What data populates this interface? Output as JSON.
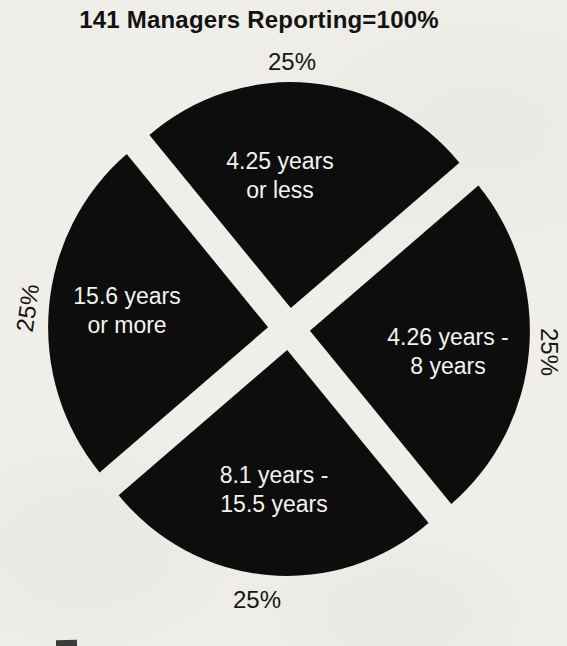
{
  "chart_data": {
    "type": "pie",
    "title": "141 Managers Reporting=100%",
    "legend_position": "none",
    "slice_color": "#0d0d0d",
    "label_color": "#f4f2ef",
    "percent_color": "#161616",
    "background_color": "#f0eee9",
    "categories": [
      "4.25 years or less",
      "4.26 years - 8 years",
      "8.1 years - 15.5 years",
      "15.6 years or more"
    ],
    "values": [
      25,
      25,
      25,
      25
    ],
    "slices": [
      {
        "id": "top",
        "label": "4.25 years or less",
        "lines": [
          "4.25 years",
          "or less"
        ],
        "value_pct": 25,
        "percent_label": "25%",
        "start_deg": 40,
        "end_deg": 130
      },
      {
        "id": "right",
        "label": "4.26 years - 8 years",
        "lines": [
          "4.26 years -",
          "8 years"
        ],
        "value_pct": 25,
        "percent_label": "25%",
        "start_deg": -50,
        "end_deg": 40
      },
      {
        "id": "bottom",
        "label": "8.1 years - 15.5 years",
        "lines": [
          "8.1 years -",
          "15.5 years"
        ],
        "value_pct": 25,
        "percent_label": "25%",
        "start_deg": 220,
        "end_deg": 310
      },
      {
        "id": "left",
        "label": "15.6 years or more",
        "lines": [
          "15.6 years",
          "or more"
        ],
        "value_pct": 25,
        "percent_label": "25%",
        "start_deg": 130,
        "end_deg": 220
      }
    ],
    "layout": {
      "center": {
        "x": 289,
        "y": 329
      },
      "radius_x": 220,
      "radius_y": 226,
      "explode_px": 21
    }
  }
}
